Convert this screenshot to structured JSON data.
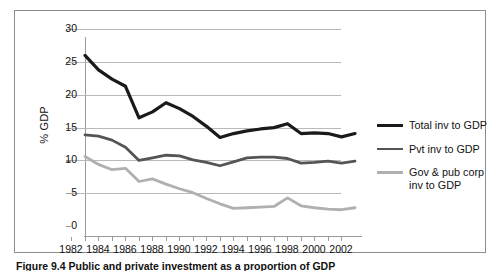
{
  "figure": {
    "caption": "Figure 9.4 Public and private investment as a proportion of GDP",
    "frame_color": "#8d8d8d",
    "background": "#ffffff"
  },
  "axes": {
    "y_title": "% GDP",
    "y_ticks": [
      "0",
      "5",
      "10",
      "15",
      "20",
      "25",
      "30"
    ],
    "x_ticks": [
      "1982",
      "1984",
      "1986",
      "1988",
      "1990",
      "1992",
      "1994",
      "1996",
      "1998",
      "2000",
      "2002"
    ],
    "gridline_color": "#b9b9b9",
    "axis_color": "#9a9a9a"
  },
  "legend": {
    "position": "right",
    "entries": [
      {
        "label": "Total inv to GDP",
        "color": "#1a1a1a"
      },
      {
        "label": "Pvt inv to GDP",
        "color": "#555555"
      },
      {
        "label": "Gov & pub corp inv to GDP",
        "color": "#b0b0b0"
      }
    ]
  },
  "chart_data": {
    "type": "line",
    "title": "",
    "subtitle": "",
    "xlabel": "",
    "ylabel": "% GDP",
    "xlim": [
      1982,
      2002
    ],
    "ylim": [
      0,
      30
    ],
    "y_tick_step": 5,
    "x_tick_step": 1,
    "x_label_step": 2,
    "grid": true,
    "legend_position": "right",
    "x": [
      1982,
      1983,
      1984,
      1985,
      1986,
      1987,
      1988,
      1989,
      1990,
      1991,
      1992,
      1993,
      1994,
      1995,
      1996,
      1997,
      1998,
      1999,
      2000,
      2001,
      2002
    ],
    "series": [
      {
        "name": "Total inv to GDP",
        "color": "#1a1a1a",
        "width": 3.2,
        "values": [
          27.5,
          25.3,
          23.9,
          22.8,
          18.0,
          18.9,
          20.3,
          19.4,
          18.2,
          16.7,
          15.0,
          15.6,
          16.0,
          16.3,
          16.5,
          17.1,
          15.6,
          15.7,
          15.6,
          15.1,
          15.6
        ]
      },
      {
        "name": "Pvt inv to GDP",
        "color": "#555555",
        "width": 2.8,
        "values": [
          15.4,
          15.2,
          14.6,
          13.5,
          11.5,
          11.9,
          12.3,
          12.2,
          11.6,
          11.2,
          10.7,
          11.3,
          11.9,
          12.0,
          12.0,
          11.8,
          11.1,
          11.2,
          11.4,
          11.1,
          11.4
        ]
      },
      {
        "name": "Gov & pub corp inv to GDP",
        "color": "#b0b0b0",
        "width": 2.8,
        "values": [
          12.1,
          10.9,
          10.1,
          10.3,
          8.3,
          8.7,
          7.9,
          7.2,
          6.6,
          5.7,
          4.9,
          4.2,
          4.3,
          4.4,
          4.5,
          5.8,
          4.6,
          4.3,
          4.1,
          4.0,
          4.3
        ]
      }
    ]
  }
}
